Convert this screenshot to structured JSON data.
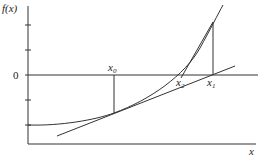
{
  "labels": {
    "y_axis": "f(x)",
    "x_axis": "x",
    "zero": "0",
    "x0": {
      "base": "x",
      "sub": "0"
    },
    "x1": {
      "base": "x",
      "sub": "1"
    },
    "x2": {
      "base": "x",
      "sub": "2"
    }
  },
  "elements": [
    "curve f(x)",
    "tangent at x0",
    "tangent at x1",
    "vertical from x0 to curve",
    "vertical from x1 to curve"
  ]
}
